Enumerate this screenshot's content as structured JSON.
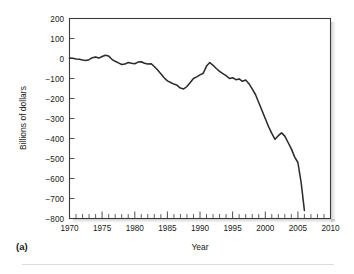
{
  "figure": {
    "panel_label": "(a)"
  },
  "chart_data": {
    "type": "line",
    "title": "",
    "xlabel": "Year",
    "ylabel": "Billions of dollars",
    "xlim": [
      1970,
      2010
    ],
    "ylim": [
      -800,
      200
    ],
    "grid": false,
    "legend": null,
    "x_ticks": [
      1970,
      1975,
      1980,
      1985,
      1990,
      1995,
      2000,
      2005,
      2010
    ],
    "x_tick_labels": [
      "1970",
      "1975",
      "1980",
      "1985",
      "1990",
      "1995",
      "2000",
      "2005",
      "2010"
    ],
    "x_minor_tick_interval": 1,
    "y_ticks": [
      200,
      100,
      0,
      -100,
      -200,
      -300,
      -400,
      -500,
      -600,
      -700,
      -800
    ],
    "y_tick_labels": [
      "200",
      "100",
      "0",
      "−100",
      "−200",
      "−300",
      "−400",
      "−500",
      "−600",
      "−700",
      "−800"
    ],
    "series": [
      {
        "name": "Trade balance",
        "color": "#2b2b2b",
        "x": [
          1970.0,
          1970.5,
          1971.0,
          1971.5,
          1972.0,
          1972.5,
          1973.0,
          1973.5,
          1974.0,
          1974.5,
          1975.0,
          1975.5,
          1976.0,
          1976.5,
          1977.0,
          1977.5,
          1978.0,
          1978.5,
          1979.0,
          1979.5,
          1980.0,
          1980.5,
          1981.0,
          1981.5,
          1982.0,
          1982.5,
          1983.0,
          1983.5,
          1984.0,
          1984.5,
          1985.0,
          1985.5,
          1986.0,
          1986.5,
          1987.0,
          1987.5,
          1988.0,
          1988.5,
          1989.0,
          1989.5,
          1990.0,
          1990.5,
          1991.0,
          1991.5,
          1992.0,
          1992.5,
          1993.0,
          1993.5,
          1994.0,
          1994.5,
          1995.0,
          1995.5,
          1996.0,
          1996.5,
          1997.0,
          1997.5,
          1998.0,
          1998.5,
          1999.0,
          1999.5,
          2000.0,
          2000.5,
          2001.0,
          2001.5,
          2002.0,
          2002.5,
          2003.0,
          2003.5,
          2004.0,
          2004.5,
          2005.0,
          2005.5,
          2006.0
        ],
        "y": [
          2,
          1,
          -2,
          -4,
          -8,
          -10,
          -6,
          4,
          8,
          2,
          10,
          16,
          12,
          -4,
          -14,
          -22,
          -30,
          -28,
          -20,
          -24,
          -26,
          -18,
          -16,
          -24,
          -28,
          -26,
          -40,
          -58,
          -76,
          -96,
          -112,
          -120,
          -128,
          -134,
          -148,
          -152,
          -140,
          -120,
          -100,
          -92,
          -82,
          -74,
          -38,
          -20,
          -34,
          -50,
          -64,
          -76,
          -86,
          -100,
          -96,
          -106,
          -102,
          -114,
          -108,
          -126,
          -152,
          -180,
          -220,
          -260,
          -300,
          -340,
          -374,
          -404,
          -386,
          -372,
          -388,
          -420,
          -452,
          -492,
          -520,
          -620,
          -760
        ]
      }
    ],
    "annotations": []
  }
}
